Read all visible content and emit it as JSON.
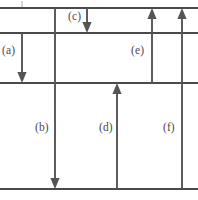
{
  "figure": {
    "kind": "energy-level-transition-diagram",
    "background_color": "#ffffff",
    "level_color": "#4a4a4a",
    "arrow_color": "#555555",
    "label_color": "#4b4b4b",
    "width": 198,
    "height": 200
  },
  "levels": [
    {
      "id": "level-top",
      "y": 8,
      "x1": 0,
      "x2": 198
    },
    {
      "id": "level-second",
      "y": 33,
      "x1": 0,
      "x2": 198
    },
    {
      "id": "level-third",
      "y": 83,
      "x1": 0,
      "x2": 198
    },
    {
      "id": "level-bottom",
      "y": 189,
      "x1": 0,
      "x2": 198
    }
  ],
  "transitions": [
    {
      "label": "(a)",
      "direction": "down",
      "x": 22,
      "from_y": 33,
      "to_y": 83,
      "label_x": 2,
      "label_y": 45
    },
    {
      "label": "(b)",
      "direction": "down",
      "x": 55,
      "from_y": 8,
      "to_y": 189,
      "label_x": 35,
      "label_y": 122
    },
    {
      "label": "(c)",
      "direction": "down",
      "x": 87,
      "from_y": 8,
      "to_y": 33,
      "label_x": 68,
      "label_y": 11
    },
    {
      "label": "(d)",
      "direction": "up",
      "x": 117,
      "from_y": 189,
      "to_y": 83,
      "label_x": 99,
      "label_y": 122
    },
    {
      "label": "(e)",
      "direction": "up",
      "x": 152,
      "from_y": 83,
      "to_y": 8,
      "label_x": 131,
      "label_y": 45
    },
    {
      "label": "(f)",
      "direction": "up",
      "x": 182,
      "from_y": 189,
      "to_y": 8,
      "label_x": 163,
      "label_y": 122
    }
  ],
  "marks": [
    {
      "id": "top-tick",
      "x": 22,
      "y1": 1,
      "y2": 7
    }
  ]
}
